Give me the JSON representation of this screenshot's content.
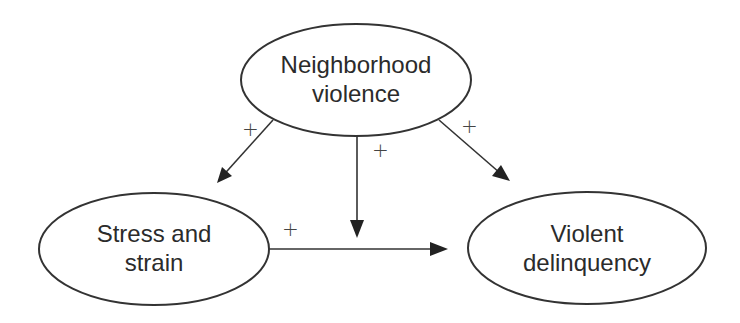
{
  "diagram": {
    "nodes": [
      {
        "id": "neighborhood_violence",
        "line1": "Neighborhood",
        "line2": "violence"
      },
      {
        "id": "stress_strain",
        "line1": "Stress and",
        "line2": "strain"
      },
      {
        "id": "violent_delinquency",
        "line1": "Violent",
        "line2": "delinquency"
      }
    ],
    "edges": [
      {
        "from": "neighborhood_violence",
        "to": "stress_strain",
        "sign": "+"
      },
      {
        "from": "neighborhood_violence",
        "to": "stress_strain->violent_delinquency",
        "sign": "+"
      },
      {
        "from": "neighborhood_violence",
        "to": "violent_delinquency",
        "sign": "+"
      },
      {
        "from": "stress_strain",
        "to": "violent_delinquency",
        "sign": "+"
      }
    ],
    "colors": {
      "stroke": "#333333",
      "text": "#2b2b2b",
      "background": "#ffffff"
    }
  }
}
